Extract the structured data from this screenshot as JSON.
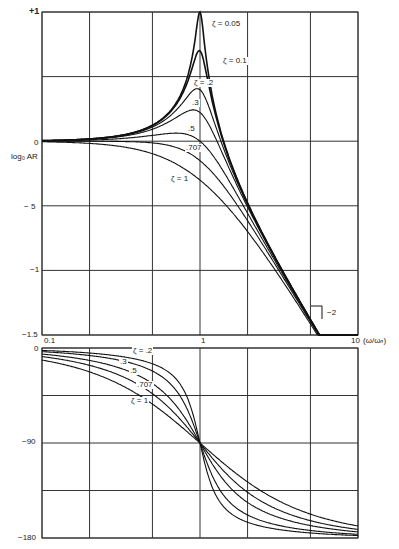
{
  "chart_data": [
    {
      "type": "line",
      "title": "",
      "xlabel": "(ω/ωn)",
      "ylabel": "log₀ AR",
      "xscale": "log",
      "xlim": [
        0.1,
        10
      ],
      "ylim": [
        -1.5,
        1
      ],
      "grid": true,
      "x_ticks": [
        "0.1",
        "1",
        "10"
      ],
      "x_grid": [
        0.1,
        0.2,
        0.5,
        1,
        2,
        5,
        10
      ],
      "y_ticks": [
        {
          "value": 1,
          "label": "+1"
        },
        {
          "value": 0.5,
          "label": ""
        },
        {
          "value": 0,
          "label": "0"
        },
        {
          "value": -0.5,
          "label": "− 5"
        },
        {
          "value": -1,
          "label": "−1"
        },
        {
          "value": -1.5,
          "label": "−1.5"
        }
      ],
      "annotations": [
        "slope −2"
      ],
      "series": [
        {
          "name": "ζ = 0.05",
          "zeta": 0.05
        },
        {
          "name": "ζ = 0.1",
          "zeta": 0.1
        },
        {
          "name": "ζ = .2",
          "zeta": 0.2
        },
        {
          "name": ".3",
          "zeta": 0.3
        },
        {
          "name": ".5",
          "zeta": 0.5
        },
        {
          "name": ".707",
          "zeta": 0.707
        },
        {
          "name": "ζ = 1",
          "zeta": 1.0
        }
      ],
      "formula": "log10(1/sqrt((1-r^2)^2 + (2*zeta*r)^2)), r = ω/ωn"
    },
    {
      "type": "line",
      "title": "",
      "xlabel": "",
      "ylabel": "phase (deg)",
      "xscale": "log",
      "xlim": [
        0.1,
        10
      ],
      "ylim": [
        -180,
        0
      ],
      "grid": true,
      "y_ticks": [
        {
          "value": 0,
          "label": "0"
        },
        {
          "value": -45,
          "label": ""
        },
        {
          "value": -90,
          "label": "−90"
        },
        {
          "value": -135,
          "label": ""
        },
        {
          "value": -180,
          "label": "−180"
        }
      ],
      "series": [
        {
          "name": "ζ = .2",
          "zeta": 0.2
        },
        {
          "name": ".3",
          "zeta": 0.3
        },
        {
          "name": ".5",
          "zeta": 0.5
        },
        {
          "name": ".707",
          "zeta": 0.707
        },
        {
          "name": "ζ = 1",
          "zeta": 1.0
        }
      ],
      "formula": "-atan2(2*zeta*r, 1-r^2) in degrees"
    }
  ],
  "labels": {
    "upper": {
      "y_top": "+1",
      "y_zero": "0",
      "y_m05": "− 5",
      "y_m1": "−1",
      "y_m15": "−1.5",
      "ylabel": "log₀ AR",
      "x_start": "0.1",
      "x_one": "1",
      "x_ten": "10",
      "x_axis": "(ω/ωₙ)",
      "slope": "−2",
      "curves": {
        "z005": "ζ = 0.05",
        "z01": "ζ = 0.1",
        "z02": "ζ = .2",
        "z03": ".3",
        "z05": ".5",
        "z0707": ".707",
        "z1": "ζ = 1"
      }
    },
    "lower": {
      "y_zero": "0",
      "y_m90": "−90",
      "y_m180": "−180",
      "curves": {
        "z02": "ζ = .2",
        "z03": ".3",
        "z05": ".5",
        "z0707": ".707",
        "z1": "ζ = 1"
      }
    }
  }
}
